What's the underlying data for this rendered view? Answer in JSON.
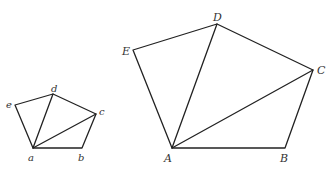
{
  "figures": {
    "small_pentagon": {
      "vertices": {
        "a": {
          "label": "a",
          "x": 33,
          "y": 148,
          "lx": 28,
          "ly": 161
        },
        "b": {
          "label": "b",
          "x": 82,
          "y": 148,
          "lx": 78,
          "ly": 161
        },
        "c": {
          "label": "c",
          "x": 96,
          "y": 114,
          "lx": 99,
          "ly": 115
        },
        "d": {
          "label": "d",
          "x": 53,
          "y": 94,
          "lx": 51,
          "ly": 92
        },
        "e": {
          "label": "e",
          "x": 15,
          "y": 105,
          "lx": 6,
          "ly": 108
        }
      },
      "diagonals": [
        "ad",
        "ac"
      ]
    },
    "large_pentagon": {
      "vertices": {
        "A": {
          "label": "A",
          "x": 172,
          "y": 148,
          "lx": 164,
          "ly": 162
        },
        "B": {
          "label": "B",
          "x": 285,
          "y": 148,
          "lx": 280,
          "ly": 162
        },
        "C": {
          "label": "C",
          "x": 313,
          "y": 70,
          "lx": 317,
          "ly": 74
        },
        "D": {
          "label": "D",
          "x": 217,
          "y": 24,
          "lx": 213,
          "ly": 21
        },
        "E": {
          "label": "E",
          "x": 133,
          "y": 50,
          "lx": 122,
          "ly": 55
        }
      },
      "diagonals": [
        "AD",
        "AC"
      ]
    }
  }
}
